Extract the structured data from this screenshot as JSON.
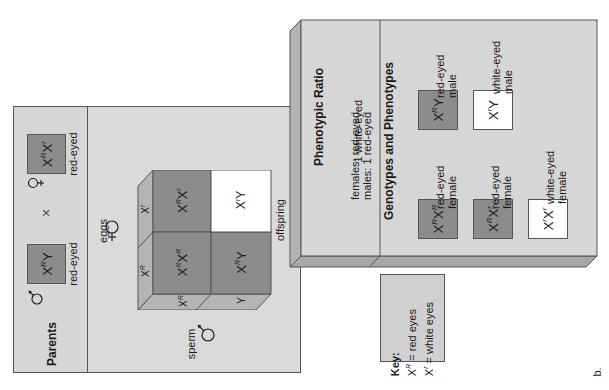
{
  "parents": {
    "title": "Parents",
    "male": {
      "symbol": "male-symbol",
      "genotype_base": "X",
      "genotype_sup": "R",
      "genotype_tail": "Y",
      "phenotype": "red-eyed"
    },
    "cross": "×",
    "female": {
      "symbol": "female-symbol",
      "genotype_a": "X",
      "sup_a": "R",
      "genotype_b": "X",
      "sup_b": "r",
      "phenotype": "red-eyed"
    }
  },
  "punnett": {
    "eggs_label": "eggs",
    "sperm_label": "sperm",
    "offspring_label": "offspring",
    "egg_alleles": [
      {
        "base": "X",
        "sup": "R"
      },
      {
        "base": "X",
        "sup": "r"
      }
    ],
    "sperm_alleles": [
      {
        "base": "X",
        "sup": "R"
      },
      {
        "base": "Y",
        "sup": ""
      }
    ],
    "cells": [
      {
        "a": "X",
        "sa": "R",
        "b": "X",
        "sb": "R",
        "color": "#8c8c8c"
      },
      {
        "a": "X",
        "sa": "R",
        "b": "X",
        "sb": "r",
        "color": "#8c8c8c"
      },
      {
        "a": "X",
        "sa": "R",
        "b": "Y",
        "sb": "",
        "color": "#8c8c8c"
      },
      {
        "a": "X",
        "sa": "r",
        "b": "Y",
        "sb": "",
        "color": "#ffffff"
      }
    ]
  },
  "ratio": {
    "title": "Phenotypic Ratio",
    "line1": "females:  red-eyed",
    "line2": "males:  1 red-eyed",
    "line3": "1 white-eyed"
  },
  "genotypes": {
    "title": "Genotypes and Phenotypes",
    "items": [
      {
        "a": "X",
        "sa": "R",
        "b": "X",
        "sb": "R",
        "label1": "red-eyed",
        "label2": "female",
        "color": "#8c8c8c"
      },
      {
        "a": "X",
        "sa": "R",
        "b": "Y",
        "sb": "",
        "label1": "red-eyed",
        "label2": "male",
        "color": "#8c8c8c"
      },
      {
        "a": "X",
        "sa": "R",
        "b": "X",
        "sb": "r",
        "label1": "red-eyed",
        "label2": "female",
        "color": "#8c8c8c"
      },
      {
        "a": "X",
        "sa": "r",
        "b": "Y",
        "sb": "",
        "label1": "white-eyed",
        "label2": "male",
        "color": "#ffffff"
      },
      {
        "a": "X",
        "sa": "r",
        "b": "X",
        "sb": "r",
        "label1": "white-eyed",
        "label2": "female",
        "color": "#ffffff"
      }
    ]
  },
  "key": {
    "title": "Key:",
    "line1_base": "X",
    "line1_sup": "R",
    "line1_text": " = red eyes",
    "line2_base": "X",
    "line2_sup": "r",
    "line2_text": " = white eyes"
  },
  "figure_label": "b.",
  "colors": {
    "panel": "#d6d6d6",
    "dark_box": "#8c8c8c",
    "side": "#b4b4b4",
    "border": "#555555"
  }
}
